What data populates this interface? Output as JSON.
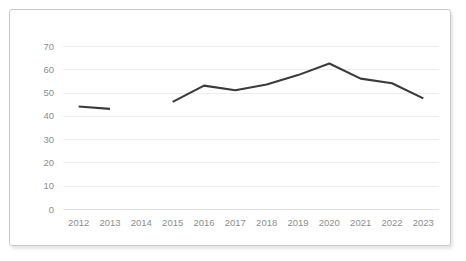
{
  "chart_data": {
    "type": "line",
    "title": "",
    "subtitle": "",
    "xlabel": "",
    "ylabel": "",
    "categories": [
      "2012",
      "2013",
      "2014",
      "2015",
      "2016",
      "2017",
      "2018",
      "2019",
      "2020",
      "2021",
      "2022",
      "2023"
    ],
    "series": [
      {
        "name": "",
        "values": [
          44,
          43,
          null,
          46,
          53,
          51,
          53.5,
          57.5,
          62.5,
          56,
          54,
          47.5
        ]
      }
    ],
    "y_ticks": [
      "0",
      "10",
      "20",
      "30",
      "40",
      "50",
      "60",
      "70"
    ],
    "y_tick_values": [
      0,
      10,
      20,
      30,
      40,
      50,
      60,
      70
    ],
    "ylim": [
      0,
      70
    ],
    "x_ticks": [
      "2012",
      "2013",
      "2014",
      "2015",
      "2016",
      "2017",
      "2018",
      "2019",
      "2020",
      "2021",
      "2022",
      "2023"
    ],
    "grid": "horizontal",
    "legend": "none",
    "gap_categories": [
      "2014"
    ],
    "annotations": [],
    "colors": {
      "line": "#3a3a3a",
      "gridline": "#ededed",
      "axis": "#e2e2e2",
      "tick_label": "#8d8d8d",
      "card_border": "#c9c9c9",
      "background": "#ffffff"
    }
  }
}
